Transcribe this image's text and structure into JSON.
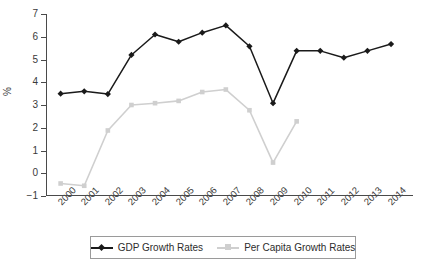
{
  "chart_data": {
    "type": "line",
    "title": "",
    "xlabel": "",
    "ylabel": "%",
    "categories": [
      "2000",
      "2001",
      "2002",
      "2003",
      "2004",
      "2005",
      "2006",
      "2007",
      "2008",
      "2009",
      "2010",
      "2011",
      "2012",
      "2013",
      "2014"
    ],
    "ylim": [
      -1,
      7
    ],
    "yticks": [
      -1,
      0,
      1,
      2,
      3,
      4,
      5,
      6,
      7
    ],
    "ytick_labels": [
      "−1",
      "0",
      "1",
      "2",
      "3",
      "4",
      "5",
      "6",
      "7"
    ],
    "grid": false,
    "legend_position": "bottom",
    "series": [
      {
        "name": "GDP Growth Rates",
        "color": "#1a1a1a",
        "marker": "diamond",
        "values": [
          3.5,
          3.6,
          3.48,
          5.2,
          6.1,
          5.78,
          6.18,
          6.5,
          5.58,
          3.08,
          5.38,
          5.38,
          5.08,
          5.38,
          5.68
        ]
      },
      {
        "name": "Per Capita Growth Rates",
        "color": "#cfcfcf",
        "marker": "square",
        "values": [
          -0.45,
          -0.55,
          1.88,
          3.0,
          3.08,
          3.18,
          3.57,
          3.68,
          2.77,
          0.47,
          2.28,
          null,
          null,
          null,
          null
        ]
      }
    ]
  },
  "legend": {
    "items": [
      {
        "label": "GDP Growth Rates",
        "color": "#1a1a1a",
        "marker": "diamond"
      },
      {
        "label": "Per Capita Growth Rates",
        "color": "#cfcfcf",
        "marker": "square"
      }
    ]
  },
  "axes": {
    "y_label": "%"
  }
}
